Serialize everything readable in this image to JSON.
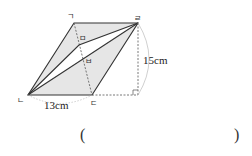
{
  "figure": {
    "vertices": {
      "top_left": {
        "label": "ㄱ"
      },
      "bottom_left": {
        "label": "ㄴ"
      },
      "bottom_right": {
        "label": "ㄷ"
      },
      "top_right": {
        "label": "ㄹ"
      },
      "point_m": {
        "label": "ㅁ"
      },
      "point_b": {
        "label": "ㅂ"
      }
    },
    "measurements": {
      "base": "13cm",
      "height": "15cm"
    },
    "colors": {
      "shaded": "#e6e6e6",
      "line": "#333333",
      "dashed": "#555555"
    }
  },
  "answer": {
    "open_paren": "(",
    "close_paren": ")",
    "value": ""
  }
}
